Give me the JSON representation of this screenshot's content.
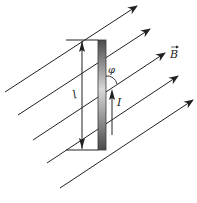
{
  "diagram": {
    "labels": {
      "field": "B",
      "current": "I",
      "length": "l",
      "angle": "φ"
    },
    "colors": {
      "line": "#222222",
      "rod_dark": "#4a4a4a",
      "rod_light": "#cfcfcf",
      "background": "#ffffff"
    },
    "field_lines": [
      {
        "x1": 5,
        "y1": 92,
        "x2": 137,
        "y2": 6
      },
      {
        "x1": 18,
        "y1": 115,
        "x2": 150,
        "y2": 29
      },
      {
        "x1": 33,
        "y1": 140,
        "x2": 165,
        "y2": 53
      },
      {
        "x1": 47,
        "y1": 163,
        "x2": 178,
        "y2": 76
      },
      {
        "x1": 60,
        "y1": 188,
        "x2": 193,
        "y2": 100
      }
    ]
  }
}
